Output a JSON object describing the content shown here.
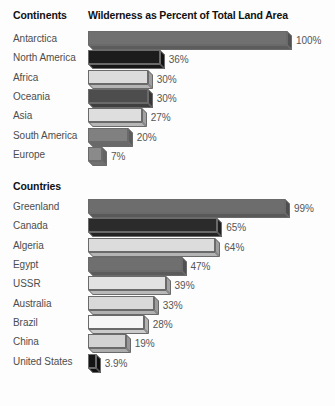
{
  "header": {
    "group_label": "Continents",
    "title": "Wilderness as Percent of Total Land Area"
  },
  "sections": [
    {
      "label": "Continents",
      "show_label_inline": true
    },
    {
      "label": "Countries",
      "show_label_inline": false
    }
  ],
  "countries_section_label": "Countries",
  "chart_data": {
    "type": "bar",
    "title": "Wilderness as Percent of Total Land Area",
    "xlabel": "",
    "ylabel": "",
    "xlim": [
      0,
      100
    ],
    "grid": false,
    "legend": "none",
    "orientation": "horizontal",
    "style": "3d-bar",
    "groups": [
      {
        "name": "Continents",
        "categories": [
          "Antarctica",
          "North America",
          "Africa",
          "Oceania",
          "Asia",
          "South America",
          "Europe"
        ],
        "values": [
          100,
          36,
          30,
          30,
          27,
          20,
          7
        ],
        "labels": [
          "100%",
          "36%",
          "30%",
          "30%",
          "27%",
          "20%",
          "7%"
        ],
        "colors": [
          "#707070",
          "#1c1c1c",
          "#dcdcdc",
          "#4d4d4d",
          "#dedede",
          "#808080",
          "#8a8a8a"
        ]
      },
      {
        "name": "Countries",
        "categories": [
          "Greenland",
          "Canada",
          "Algeria",
          "Egypt",
          "USSR",
          "Australia",
          "Brazil",
          "China",
          "United States"
        ],
        "values": [
          99,
          65,
          64,
          47,
          39,
          33,
          28,
          19,
          3.9
        ],
        "labels": [
          "99%",
          "65%",
          "64%",
          "47%",
          "39%",
          "33%",
          "28%",
          "19%",
          "3.9%"
        ],
        "colors": [
          "#6d6d6d",
          "#2b2b2b",
          "#dcdcdc",
          "#6f6f6f",
          "#e2e2e2",
          "#d9d9d9",
          "#f7f7f7",
          "#d2d2d2",
          "#141414"
        ]
      }
    ]
  }
}
